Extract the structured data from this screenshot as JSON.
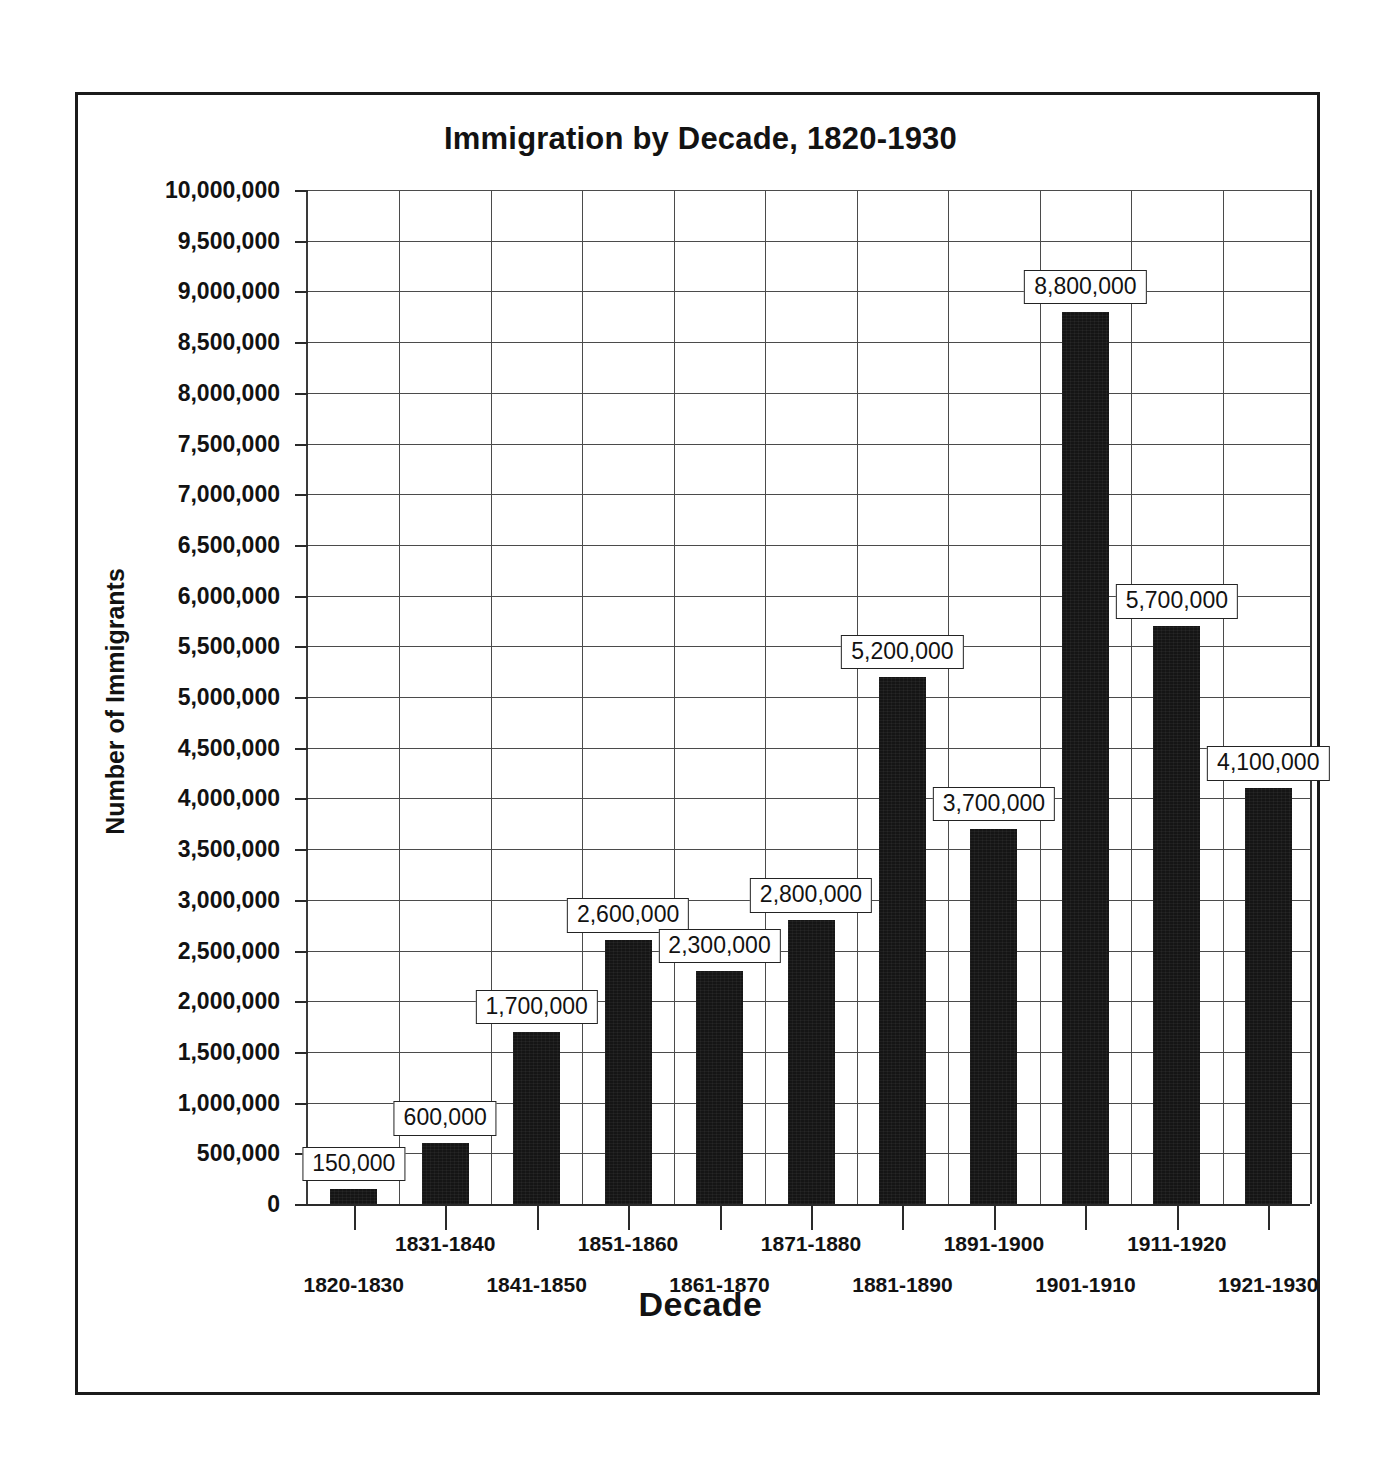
{
  "chart_data": {
    "type": "bar",
    "title": "Immigration by Decade, 1820-1930",
    "xlabel": "Decade",
    "ylabel": "Number of Immigrants",
    "ylim": [
      0,
      10000000
    ],
    "ytick_step": 500000,
    "grid": true,
    "legend": null,
    "bar_color": "#151515",
    "categories": [
      "1820-1830",
      "1831-1840",
      "1841-1850",
      "1851-1860",
      "1861-1870",
      "1871-1880",
      "1881-1890",
      "1891-1900",
      "1901-1910",
      "1911-1920",
      "1921-1930"
    ],
    "values": [
      150000,
      600000,
      1700000,
      2600000,
      2300000,
      2800000,
      5200000,
      3700000,
      8800000,
      5700000,
      4100000
    ],
    "value_labels": [
      "150,000",
      "600,000",
      "1,700,000",
      "2,600,000",
      "2,300,000",
      "2,800,000",
      "5,200,000",
      "3,700,000",
      "8,800,000",
      "5,700,000",
      "4,100,000"
    ],
    "ytick_labels": [
      "10,000,000",
      "9,500,000",
      "9,000,000",
      "8,500,000",
      "8,000,000",
      "7,500,000",
      "7,000,000",
      "6,500,000",
      "6,000,000",
      "5,500,000",
      "5,000,000",
      "4,500,000",
      "4,000,000",
      "3,500,000",
      "3,000,000",
      "2,500,000",
      "2,000,000",
      "1,500,000",
      "1,000,000",
      "500,000",
      "0"
    ],
    "ytick_values": [
      10000000,
      9500000,
      9000000,
      8500000,
      8000000,
      7500000,
      7000000,
      6500000,
      6000000,
      5500000,
      5000000,
      4500000,
      4000000,
      3500000,
      3000000,
      2500000,
      2000000,
      1500000,
      1000000,
      500000,
      0
    ]
  }
}
